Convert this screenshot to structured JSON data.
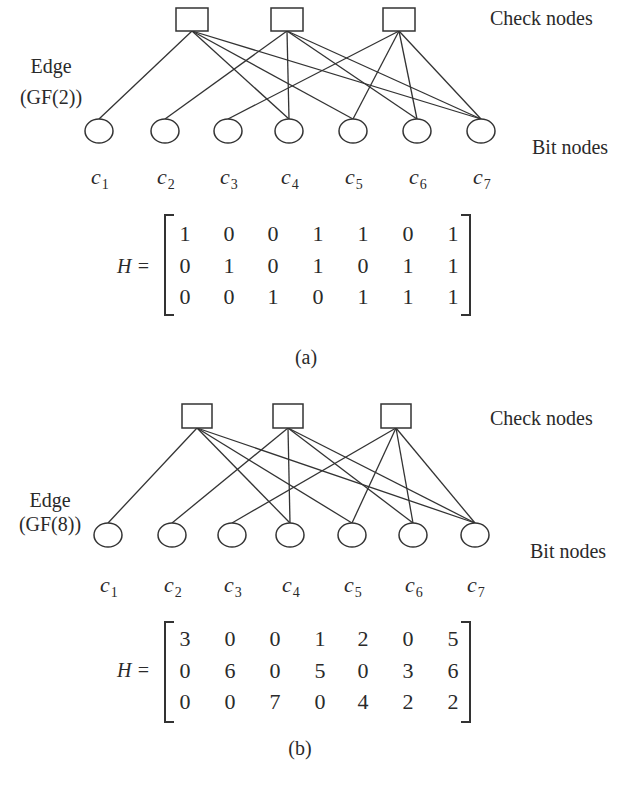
{
  "panels": [
    {
      "id": "a",
      "caption": "(a)",
      "check_nodes_label": "Check nodes",
      "bit_nodes_label": "Bit nodes",
      "edge_label_line1": "Edge",
      "edge_label_line2": "(GF(2))",
      "matrix_label": "H =",
      "bit_labels": [
        {
          "base": "c",
          "sub": "1"
        },
        {
          "base": "c",
          "sub": "2"
        },
        {
          "base": "c",
          "sub": "3"
        },
        {
          "base": "c",
          "sub": "4"
        },
        {
          "base": "c",
          "sub": "5"
        },
        {
          "base": "c",
          "sub": "6"
        },
        {
          "base": "c",
          "sub": "7"
        }
      ],
      "matrix": [
        [
          1,
          0,
          0,
          1,
          1,
          0,
          1
        ],
        [
          0,
          1,
          0,
          1,
          0,
          1,
          1
        ],
        [
          0,
          0,
          1,
          0,
          1,
          1,
          1
        ]
      ]
    },
    {
      "id": "b",
      "caption": "(b)",
      "check_nodes_label": "Check nodes",
      "bit_nodes_label": "Bit nodes",
      "edge_label_line1": "Edge",
      "edge_label_line2": "(GF(8))",
      "matrix_label": "H =",
      "bit_labels": [
        {
          "base": "c",
          "sub": "1"
        },
        {
          "base": "c",
          "sub": "2"
        },
        {
          "base": "c",
          "sub": "3"
        },
        {
          "base": "c",
          "sub": "4"
        },
        {
          "base": "c",
          "sub": "5"
        },
        {
          "base": "c",
          "sub": "6"
        },
        {
          "base": "c",
          "sub": "7"
        }
      ],
      "matrix": [
        [
          3,
          0,
          0,
          1,
          2,
          0,
          5
        ],
        [
          0,
          6,
          0,
          5,
          0,
          3,
          6
        ],
        [
          0,
          0,
          7,
          0,
          4,
          2,
          2
        ]
      ]
    }
  ],
  "colors": {
    "stroke": "#333333",
    "text": "#2a2a2a",
    "background": "#ffffff"
  }
}
